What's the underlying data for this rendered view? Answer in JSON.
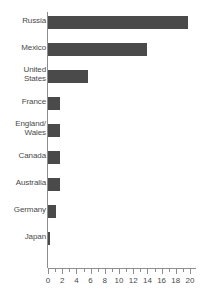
{
  "chart_data": {
    "type": "bar",
    "orientation": "horizontal",
    "title": "",
    "subtitle": "",
    "xlabel": "",
    "ylabel": "",
    "xlim": [
      0,
      20
    ],
    "ylim": null,
    "grid": false,
    "legend": null,
    "bar_color": "#4a4a4a",
    "axis_color": "#8d8d8d",
    "text_color": "#4a4a4a",
    "background": "#ffffff",
    "xticks": [
      0,
      2,
      4,
      6,
      8,
      10,
      12,
      14,
      16,
      18,
      20
    ],
    "xtick_labels": [
      "0",
      "2",
      "4",
      "6",
      "8",
      "10",
      "12",
      "14",
      "16",
      "18",
      "20"
    ],
    "minor_tick_step": 1,
    "categories": [
      "Russia",
      "Mexico",
      "United\nStates",
      "France",
      "England/\nWales",
      "Canada",
      "Australia",
      "Germany",
      "Japan"
    ],
    "values": [
      19.7,
      14.0,
      5.6,
      1.7,
      1.7,
      1.7,
      1.7,
      1.1,
      0.3
    ]
  }
}
